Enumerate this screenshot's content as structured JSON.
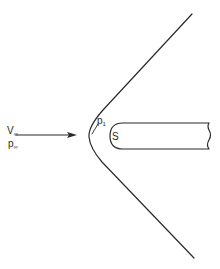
{
  "diagram": {
    "labels": {
      "freestream_velocity": {
        "main": "V",
        "sub": "∞"
      },
      "freestream_pressure": {
        "main": "p",
        "sub": "∞"
      },
      "post_shock_pressure": {
        "main": "p",
        "sub": "1"
      },
      "stagnation_point": "S"
    },
    "elements": [
      "bow-shock",
      "blunt-body",
      "freestream-arrow",
      "p1-leader-line"
    ],
    "colors": {
      "ink": "#2a2a2a",
      "background": "#ffffff"
    }
  }
}
